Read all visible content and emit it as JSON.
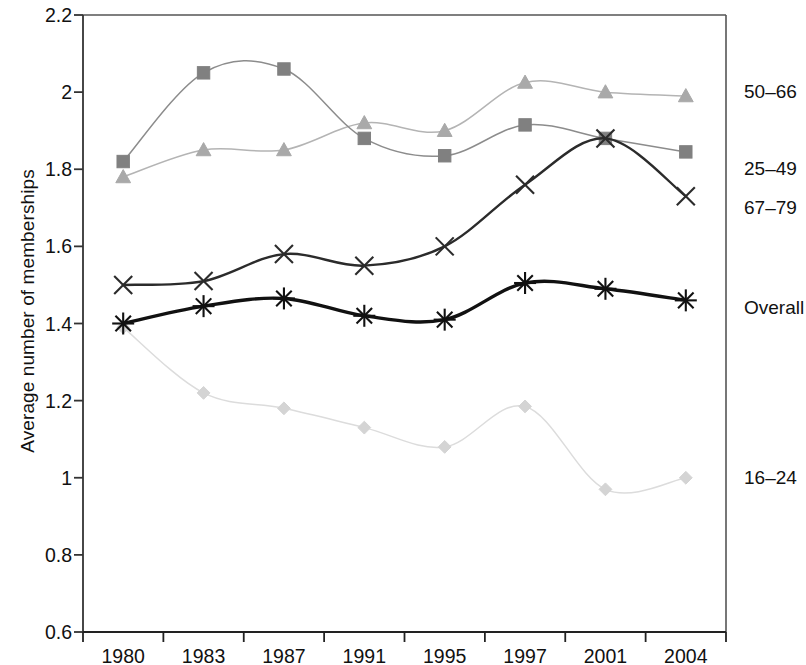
{
  "chart_data": {
    "type": "line",
    "title": "",
    "xlabel": "",
    "ylabel": "Average number of memberships",
    "categories": [
      "1980",
      "1983",
      "1987",
      "1991",
      "1995",
      "1997",
      "2001",
      "2004"
    ],
    "ylim": [
      0.6,
      2.2
    ],
    "ytick_labels": [
      "2.2",
      "2",
      "1.8",
      "1.6",
      "1.4",
      "1.2",
      "1",
      "0.8",
      "0.6"
    ],
    "ytick_values": [
      2.2,
      2.0,
      1.8,
      1.6,
      1.4,
      1.2,
      1.0,
      0.8,
      0.6
    ],
    "grid": false,
    "legend_position": "right-of-axes",
    "series": [
      {
        "name": "50–66",
        "marker": "triangle",
        "color": "#a9a9a9",
        "line_color": "#b4b4b4",
        "values": [
          1.78,
          1.85,
          1.85,
          1.92,
          1.9,
          2.025,
          2.0,
          1.99
        ]
      },
      {
        "name": "25–49",
        "marker": "square",
        "color": "#808080",
        "line_color": "#8c8c8c",
        "values": [
          1.82,
          2.05,
          2.06,
          1.88,
          1.835,
          1.915,
          1.88,
          1.845
        ]
      },
      {
        "name": "67–79",
        "marker": "x",
        "color": "#2b2b2b",
        "line_color": "#2b2b2b",
        "values": [
          1.5,
          1.51,
          1.58,
          1.55,
          1.6,
          1.76,
          1.88,
          1.73
        ]
      },
      {
        "name": "Overall",
        "marker": "asterisk",
        "color": "#111111",
        "line_color": "#111111",
        "values": [
          1.4,
          1.445,
          1.465,
          1.42,
          1.41,
          1.505,
          1.49,
          1.46
        ]
      },
      {
        "name": "16–24",
        "marker": "diamond",
        "color": "#d4d4d4",
        "line_color": "#dcdcdc",
        "values": [
          1.39,
          1.22,
          1.18,
          1.13,
          1.08,
          1.185,
          0.97,
          1.0
        ]
      }
    ],
    "series_label_positions": [
      {
        "name": "50–66",
        "y_value": 2.0
      },
      {
        "name": "25–49",
        "y_value": 1.8
      },
      {
        "name": "67–79",
        "y_value": 1.7
      },
      {
        "name": "Overall",
        "y_value": 1.44
      },
      {
        "name": "16–24",
        "y_value": 1.0
      }
    ]
  },
  "axes": {
    "frame_color": "#555555"
  }
}
